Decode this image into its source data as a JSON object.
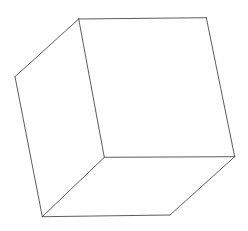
{
  "diagram": {
    "type": "wireframe-cube",
    "background": "#ffffff",
    "stroke_color": "#4a4a4a",
    "stroke_width": 0.9,
    "vertices": {
      "top_left": [
        78.7,
        19.0
      ],
      "top_right": [
        206.3,
        17.7
      ],
      "right": [
        234.7,
        156.7
      ],
      "inner": [
        104.3,
        157.3
      ],
      "left": [
        15.0,
        76.7
      ],
      "bottom_left": [
        42.3,
        216.7
      ],
      "bottom_right": [
        170.0,
        215.0
      ]
    },
    "edges": [
      [
        "top_left",
        "top_right"
      ],
      [
        "top_right",
        "right"
      ],
      [
        "right",
        "inner"
      ],
      [
        "inner",
        "top_left"
      ],
      [
        "top_left",
        "left"
      ],
      [
        "left",
        "bottom_left"
      ],
      [
        "bottom_left",
        "inner"
      ],
      [
        "bottom_left",
        "bottom_right"
      ],
      [
        "bottom_right",
        "right"
      ]
    ],
    "faces": [
      {
        "name": "front-face",
        "vertices": [
          "top_left",
          "top_right",
          "right",
          "inner"
        ]
      },
      {
        "name": "left-face",
        "vertices": [
          "top_left",
          "inner",
          "bottom_left",
          "left"
        ]
      },
      {
        "name": "bottom-face",
        "vertices": [
          "inner",
          "right",
          "bottom_right",
          "bottom_left"
        ]
      }
    ]
  }
}
